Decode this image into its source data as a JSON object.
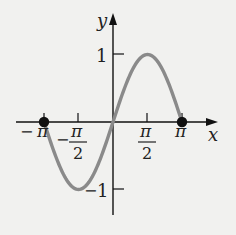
{
  "chart_data": {
    "type": "line",
    "title": "",
    "function": "y = sin x",
    "xlabel": "x",
    "ylabel": "y",
    "xlim": [
      -3.14159,
      3.14159
    ],
    "ylim": [
      -1,
      1
    ],
    "x_ticks": [
      "-π",
      "-π/2",
      "π/2",
      "π"
    ],
    "y_ticks": [
      "1",
      "-1"
    ],
    "series": [
      {
        "name": "sin x",
        "x": [
          -3.14159,
          -1.5708,
          0,
          1.5708,
          3.14159
        ],
        "y": [
          0,
          -1,
          0,
          1,
          0
        ]
      }
    ],
    "endpoints": [
      {
        "x": -3.14159,
        "y": 0,
        "label": "-π"
      },
      {
        "x": 3.14159,
        "y": 0,
        "label": "π"
      }
    ],
    "grid": false,
    "curve_color": "#8a8a8a"
  },
  "labels": {
    "x_axis": "x",
    "y_axis": "y",
    "tick_y_pos": "1",
    "tick_y_neg": "1",
    "tick_y_neg_sign": "−",
    "neg_pi_sign": "−",
    "pi": "π",
    "neg_half_sign": "−",
    "half_num": "π",
    "half_den": "2"
  }
}
